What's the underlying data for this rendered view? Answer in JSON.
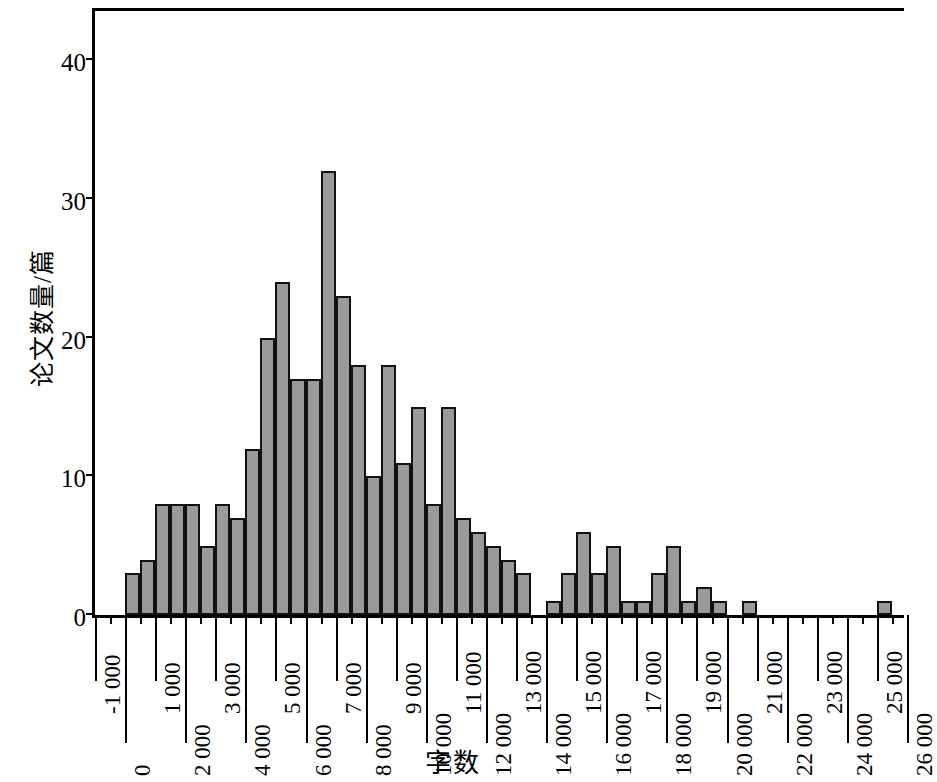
{
  "chart_data": {
    "type": "bar",
    "title": "",
    "subtitle": "",
    "xlabel": "字数",
    "ylabel": "论文数量/篇",
    "bin_width": 500,
    "xlim": [
      -1000,
      26000
    ],
    "ylim": [
      0,
      44
    ],
    "grid": false,
    "legend": null,
    "x_tick_labels_upper": [
      "-1 000",
      "1 000",
      "3 000",
      "5 000",
      "7 000",
      "9 000",
      "11 000",
      "13 000",
      "15 000",
      "17 000",
      "19 000",
      "21 000",
      "23 000",
      "25 000"
    ],
    "x_tick_labels_lower": [
      "0",
      "2 000",
      "4 000",
      "6 000",
      "8 000",
      "10 000",
      "12 000",
      "14 000",
      "16 000",
      "18 000",
      "20 000",
      "22 000",
      "24 000",
      "26 000"
    ],
    "x_tick_values_upper": [
      -1000,
      1000,
      3000,
      5000,
      7000,
      9000,
      11000,
      13000,
      15000,
      17000,
      19000,
      21000,
      23000,
      25000
    ],
    "x_tick_values_lower": [
      0,
      2000,
      4000,
      6000,
      8000,
      10000,
      12000,
      14000,
      16000,
      18000,
      20000,
      22000,
      24000,
      26000
    ],
    "y_tick_labels": [
      "0",
      "10",
      "20",
      "30",
      "40"
    ],
    "y_tick_values": [
      0,
      10,
      20,
      30,
      40
    ],
    "bin_starts": [
      0,
      500,
      1000,
      1500,
      2000,
      2500,
      3000,
      3500,
      4000,
      4500,
      5000,
      5500,
      6000,
      6500,
      7000,
      7500,
      8000,
      8500,
      9000,
      9500,
      10000,
      10500,
      11000,
      11500,
      12000,
      12500,
      13000,
      13500,
      14000,
      14500,
      15000,
      15500,
      16000,
      16500,
      17000,
      17500,
      18000,
      18500,
      19000,
      19500,
      20000,
      20500,
      21000,
      21500,
      22000,
      22500,
      23000,
      23500,
      24000,
      24500,
      25000,
      25500
    ],
    "values": [
      3,
      4,
      8,
      8,
      8,
      5,
      8,
      7,
      12,
      20,
      24,
      17,
      17,
      32,
      23,
      18,
      10,
      18,
      11,
      15,
      8,
      15,
      7,
      6,
      5,
      4,
      3,
      0,
      1,
      3,
      6,
      3,
      5,
      1,
      1,
      3,
      5,
      1,
      2,
      1,
      0,
      1,
      0,
      0,
      0,
      0,
      0,
      0,
      0,
      0,
      1,
      0
    ],
    "bar_fill_color": "#9a9a9a",
    "bar_edge_color": "#111111",
    "axis_color": "#000000",
    "background_color": "#ffffff",
    "max_value": 32,
    "peak_bin": "6 500 – 7 000"
  }
}
